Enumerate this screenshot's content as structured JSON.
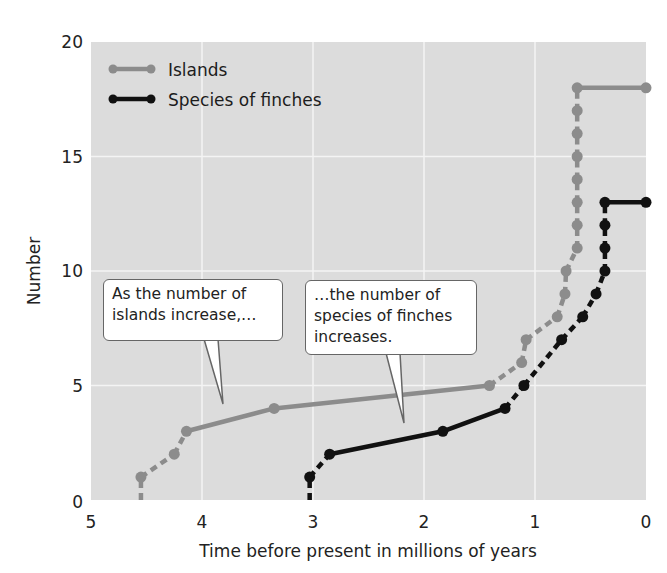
{
  "chart_data": {
    "type": "line",
    "title": "",
    "xlabel": "Time before present in millions of years",
    "ylabel": "Number",
    "xlim": [
      5,
      0
    ],
    "ylim": [
      0,
      20
    ],
    "x_reversed": true,
    "x_ticks": [
      "5",
      "4",
      "3",
      "2",
      "1",
      "0"
    ],
    "y_ticks": [
      "0",
      "5",
      "10",
      "15",
      "20"
    ],
    "grid": true,
    "legend_position": "upper left",
    "series": [
      {
        "name": "Islands",
        "color": "#8c8c8c",
        "points": [
          {
            "x": 4.55,
            "y": 0
          },
          {
            "x": 4.55,
            "y": 1
          },
          {
            "x": 4.25,
            "y": 2
          },
          {
            "x": 4.14,
            "y": 3
          },
          {
            "x": 3.35,
            "y": 4
          },
          {
            "x": 1.41,
            "y": 5
          },
          {
            "x": 1.12,
            "y": 6
          },
          {
            "x": 1.08,
            "y": 7
          },
          {
            "x": 0.8,
            "y": 8
          },
          {
            "x": 0.73,
            "y": 9
          },
          {
            "x": 0.72,
            "y": 10
          },
          {
            "x": 0.62,
            "y": 11
          },
          {
            "x": 0.62,
            "y": 12
          },
          {
            "x": 0.62,
            "y": 13
          },
          {
            "x": 0.62,
            "y": 14
          },
          {
            "x": 0.62,
            "y": 15
          },
          {
            "x": 0.62,
            "y": 16
          },
          {
            "x": 0.62,
            "y": 17
          },
          {
            "x": 0.62,
            "y": 18
          },
          {
            "x": 0.0,
            "y": 18
          }
        ]
      },
      {
        "name": "Species of finches",
        "color": "#111111",
        "points": [
          {
            "x": 3.03,
            "y": 0
          },
          {
            "x": 3.03,
            "y": 1
          },
          {
            "x": 2.85,
            "y": 2
          },
          {
            "x": 1.83,
            "y": 3
          },
          {
            "x": 1.27,
            "y": 4
          },
          {
            "x": 1.1,
            "y": 5
          },
          {
            "x": 0.76,
            "y": 7
          },
          {
            "x": 0.57,
            "y": 8
          },
          {
            "x": 0.45,
            "y": 9
          },
          {
            "x": 0.37,
            "y": 10
          },
          {
            "x": 0.37,
            "y": 11
          },
          {
            "x": 0.37,
            "y": 12
          },
          {
            "x": 0.37,
            "y": 13
          },
          {
            "x": 0.0,
            "y": 13
          }
        ]
      }
    ],
    "annotations": [
      {
        "text": "As the number of\nislands increase,…",
        "points_to": {
          "x": 3.8,
          "y": 3.5
        }
      },
      {
        "text": "…the number of\nspecies of finches\nincreases.",
        "points_to": {
          "x": 2.1,
          "y": 2.7
        }
      }
    ]
  },
  "legend": {
    "items": [
      {
        "label": "Islands",
        "color": "#8c8c8c"
      },
      {
        "label": "Species of finches",
        "color": "#111111"
      }
    ]
  },
  "callouts": {
    "islands": "As the number of\nislands increase,…",
    "finches": "…the number of\nspecies of finches\nincreases."
  },
  "axes": {
    "xlabel": "Time before present in millions of years",
    "ylabel": "Number",
    "x_ticks": [
      "5",
      "4",
      "3",
      "2",
      "1",
      "0"
    ],
    "y_ticks": [
      "0",
      "5",
      "10",
      "15",
      "20"
    ]
  },
  "style": {
    "plot_bg": "#dcdcdc",
    "grid_color": "#f4f4f4"
  }
}
